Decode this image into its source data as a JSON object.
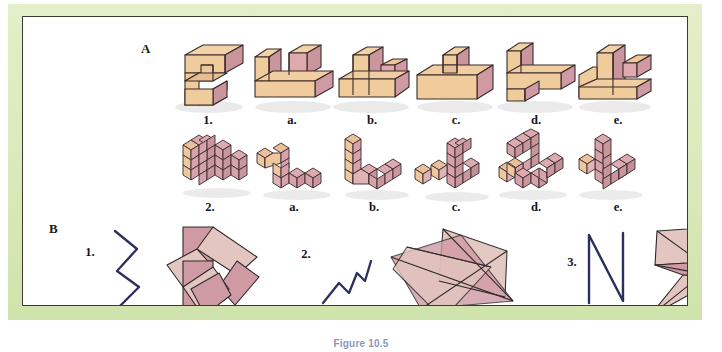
{
  "figure": {
    "caption": "Figure 10.5",
    "frame_color": "#dceabc",
    "plate_border_color": "#3a3a32",
    "background": "#ffffff"
  },
  "sections": [
    {
      "letter": "A",
      "rows": [
        {
          "row_id": "row-solid-blocks",
          "shape_kind": "solid-block-figure",
          "labels": [
            "1.",
            "a.",
            "b.",
            "c.",
            "d.",
            "e."
          ]
        },
        {
          "row_id": "row-cube-assemblies",
          "shape_kind": "cube-assembly-figure",
          "labels": [
            "2.",
            "a.",
            "b.",
            "c.",
            "d.",
            "e."
          ]
        }
      ]
    },
    {
      "letter": "B",
      "items": [
        {
          "label": "1.",
          "line_name": "zigzag-line-vertical",
          "polygon_name": "pinwheel-polygon-group"
        },
        {
          "label": "2.",
          "line_name": "zigzag-line-diagonal",
          "polygon_name": "overlapping-quadrilaterals"
        },
        {
          "label": "3.",
          "line_name": "n-shaped-line",
          "polygon_name": "kite-and-arrow-polygon"
        }
      ]
    }
  ],
  "palette": {
    "block_top": "#f2d2a8",
    "block_left": "#f0cb9c",
    "block_right": "#d9a3a8",
    "block_face_pink": "#d9a8ae",
    "block_outline": "#3b2b2b",
    "cube_top": "#e9c09a",
    "cube_left": "#efc79f",
    "cube_right": "#d7a2ab",
    "cube_pink_top": "#dcaab1",
    "polygon_dark": "#cf9aa4",
    "polygon_light": "#e3c6bf",
    "line_stroke": "#2b2f5e",
    "shadow": "#cfcfcf"
  }
}
